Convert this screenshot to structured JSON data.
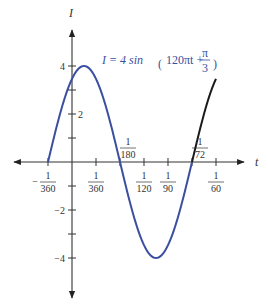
{
  "chart_data": {
    "type": "line",
    "title": "",
    "equation": {
      "lhs": "I = 4 sin",
      "arg_main": "120πt +",
      "frac_num": "π",
      "frac_den": "3"
    },
    "xlabel": "t",
    "ylabel": "I",
    "xlim": [
      -0.00347,
      0.0185
    ],
    "ylim": [
      -5.5,
      5.5
    ],
    "grid": false,
    "x_ticks": [
      {
        "num": "1",
        "den": "360",
        "sign": "−",
        "value": -0.002778,
        "position": "below"
      },
      {
        "num": "1",
        "den": "360",
        "sign": "",
        "value": 0.002778,
        "position": "below"
      },
      {
        "num": "1",
        "den": "180",
        "sign": "",
        "value": 0.005556,
        "position": "above"
      },
      {
        "num": "1",
        "den": "120",
        "sign": "",
        "value": 0.008333,
        "position": "below"
      },
      {
        "num": "1",
        "den": "90",
        "sign": "",
        "value": 0.011111,
        "position": "below"
      },
      {
        "num": "1",
        "den": "72",
        "sign": "",
        "value": 0.013889,
        "position": "above"
      },
      {
        "num": "1",
        "den": "60",
        "sign": "",
        "value": 0.016667,
        "position": "below"
      }
    ],
    "y_ticks": [
      {
        "value": 4,
        "label": "4"
      },
      {
        "value": 3,
        "label": ""
      },
      {
        "value": 2,
        "label": "2"
      },
      {
        "value": 1,
        "label": ""
      },
      {
        "value": -1,
        "label": ""
      },
      {
        "value": -2,
        "label": "−2"
      },
      {
        "value": -3,
        "label": ""
      },
      {
        "value": -4,
        "label": "−4"
      }
    ],
    "series": [
      {
        "name": "one period",
        "color": "#3b4fa0",
        "function": "4*sin(120*pi*t + pi/3)",
        "t_range": [
          -0.002778,
          0.013889
        ],
        "key_points": [
          {
            "t": -0.002778,
            "I": 0
          },
          {
            "t": 0,
            "I": 3.46
          },
          {
            "t": 0.001389,
            "I": 4
          },
          {
            "t": 0.005556,
            "I": 0
          },
          {
            "t": 0.009722,
            "I": -4
          },
          {
            "t": 0.013889,
            "I": 0
          }
        ]
      },
      {
        "name": "continuation",
        "color": "#1a1a1a",
        "function": "4*sin(120*pi*t + pi/3)",
        "t_range": [
          0.013889,
          0.016667
        ],
        "key_points": [
          {
            "t": 0.013889,
            "I": 0
          },
          {
            "t": 0.016667,
            "I": 3.46
          }
        ]
      }
    ]
  }
}
